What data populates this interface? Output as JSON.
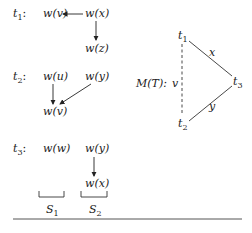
{
  "diagram": {
    "rows": [
      {
        "label": "t",
        "label_sub": "1",
        "colon": ":",
        "left": "w(v)",
        "right": "w(x)",
        "below": "w(z)"
      },
      {
        "label": "t",
        "label_sub": "2",
        "colon": ":",
        "left": "w(u)",
        "right": "w(y)",
        "below": "w(v)"
      },
      {
        "label": "t",
        "label_sub": "3",
        "colon": ":",
        "left": "w(w)",
        "right": "w(y)",
        "below": "w(x)"
      }
    ],
    "sets": [
      {
        "label": "S",
        "sub": "1"
      },
      {
        "label": "S",
        "sub": "2"
      }
    ],
    "graph": {
      "title": "M(T):",
      "nodes": [
        {
          "label": "t",
          "sub": "1"
        },
        {
          "label": "t",
          "sub": "2"
        },
        {
          "label": "t",
          "sub": "3"
        }
      ],
      "edges": [
        {
          "from": "t1",
          "to": "t3",
          "label": "x",
          "style": "solid"
        },
        {
          "from": "t2",
          "to": "t3",
          "label": "y",
          "style": "solid"
        },
        {
          "from": "t1",
          "to": "t2",
          "label": "v",
          "style": "dashed"
        }
      ]
    },
    "colors": {
      "ink": "#222222",
      "rule": "#555555"
    }
  }
}
